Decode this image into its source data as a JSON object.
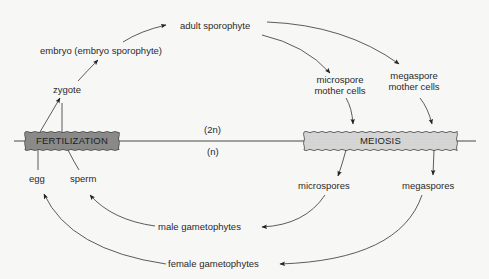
{
  "diagram": {
    "colors": {
      "background": "#f7f7f5",
      "line": "#333333",
      "fertilization_fill": "#8a8a8a",
      "fertilization_text": "#1e1e1e",
      "meiosis_fill": "#d6d6d6",
      "meiosis_text": "#222222"
    },
    "phases": {
      "fertilization": "FERTILIZATION",
      "meiosis": "MEIOSIS"
    },
    "ploidy": {
      "diploid": "(2n)",
      "haploid": "(n)"
    },
    "stages": {
      "zygote": "zygote",
      "embryo": "embryo (embryo sporophyte)",
      "adult_sporophyte": "adult sporophyte",
      "microspore_mother_cells_line1": "microspore",
      "microspore_mother_cells_line2": "mother cells",
      "megaspore_mother_cells_line1": "megaspore",
      "megaspore_mother_cells_line2": "mother cells",
      "microspores": "microspores",
      "megaspores": "megaspores",
      "male_gametophytes": "male gametophytes",
      "female_gametophytes": "female gametophytes",
      "egg": "egg",
      "sperm": "sperm"
    }
  }
}
